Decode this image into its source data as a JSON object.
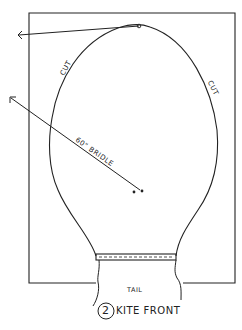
{
  "diagram": {
    "figure_number": "2",
    "caption": "KITE FRONT",
    "labels": {
      "cut_left": "CUT",
      "cut_right": "CUT",
      "bridle": "60\" BRIDLE",
      "tail": "TAIL"
    },
    "colors": {
      "ink": "#222222",
      "paper": "#ffffff"
    }
  }
}
